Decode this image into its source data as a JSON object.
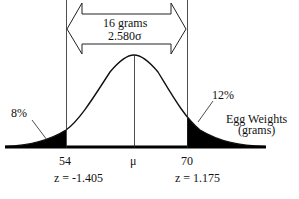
{
  "diagram": {
    "type": "normal-distribution",
    "range_annotation": {
      "width_label": "16 grams",
      "sigma_label": "2.580σ"
    },
    "x_axis": {
      "label_line1": "Egg Weights",
      "label_line2": "(grams)",
      "ticks": [
        {
          "id": "lower",
          "value": "54",
          "z_label": "z = -1.405"
        },
        {
          "id": "mean",
          "value": "μ"
        },
        {
          "id": "upper",
          "value": "70",
          "z_label": "z = 1.175"
        }
      ]
    },
    "tails": {
      "left": {
        "percent": "8%"
      },
      "right": {
        "percent": "12%"
      }
    },
    "colors": {
      "ink": "#111111",
      "fill": "#000000",
      "background": "#ffffff"
    }
  }
}
